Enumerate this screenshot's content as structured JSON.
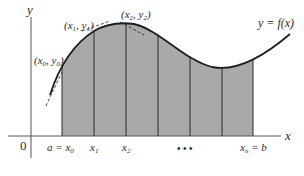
{
  "diagram": {
    "axes": {
      "x_label": "x",
      "y_label": "y",
      "origin_label": "0"
    },
    "curve_label": "y = f(x)",
    "point_labels": [
      {
        "id": "p0",
        "text_main": "(x",
        "sub1": "0",
        "mid": ", y",
        "sub2": "0",
        "end": ")"
      },
      {
        "id": "p1",
        "text_main": "(x",
        "sub1": "1",
        "mid": ", y",
        "sub2": "1",
        "end": ")"
      },
      {
        "id": "p2",
        "text_main": "(x",
        "sub1": "2",
        "mid": ", y",
        "sub2": "2",
        "end": ")"
      }
    ],
    "x_tick_labels": {
      "a": "a = x",
      "a_sub": "0",
      "x1": "x",
      "x1_sub": "1",
      "x2": "x",
      "x2_sub": "2",
      "ellipsis": "• • •",
      "xn": "x",
      "xn_sub": "n",
      "b": " = b"
    },
    "colors": {
      "shade": "#a9a9a9",
      "line": "#1e1e1e",
      "axis": "#555555"
    }
  }
}
